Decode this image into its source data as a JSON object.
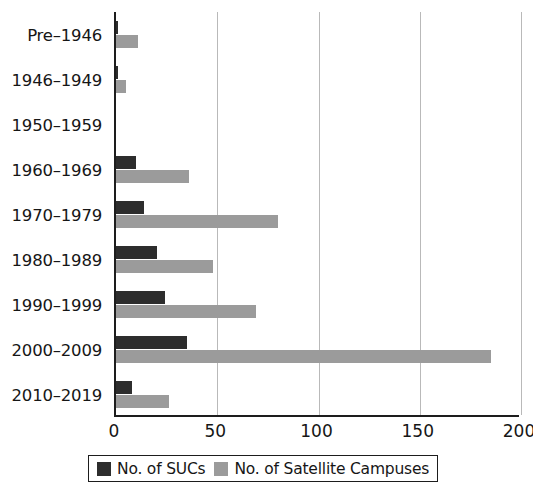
{
  "chart_data": {
    "type": "bar",
    "orientation": "horizontal",
    "title": "",
    "subtitle": "",
    "xlabel": "",
    "ylabel": "",
    "xlim": [
      0,
      200
    ],
    "ylim": null,
    "grid": true,
    "grid_axis": "x",
    "legend_position": "bottom",
    "xticks": [
      0,
      50,
      100,
      150,
      200
    ],
    "xtick_labels": [
      "0",
      "50",
      "100",
      "150",
      "200"
    ],
    "categories": [
      "Pre–1946",
      "1946–1949",
      "1950–1959",
      "1960–1969",
      "1970–1979",
      "1980–1989",
      "1990–1999",
      "2000–2009",
      "2010–2019"
    ],
    "series": [
      {
        "name": "No. of SUCs",
        "color": "#2d2d2d",
        "values": [
          1,
          1,
          0,
          10,
          14,
          20,
          24,
          35,
          8
        ]
      },
      {
        "name": "No. of Satellite Campuses",
        "color": "#9b9b9b",
        "values": [
          11,
          5,
          0,
          36,
          80,
          48,
          69,
          185,
          26
        ]
      }
    ]
  },
  "legend": {
    "entries": [
      {
        "label": "No. of SUCs",
        "color": "#2d2d2d",
        "swatch": "dark"
      },
      {
        "label": "No. of Satellite Campuses",
        "color": "#9b9b9b",
        "swatch": "gray"
      }
    ]
  },
  "axis": {
    "axis_color": "#1d1d1d",
    "gridline_color": "#b9b9b9"
  }
}
